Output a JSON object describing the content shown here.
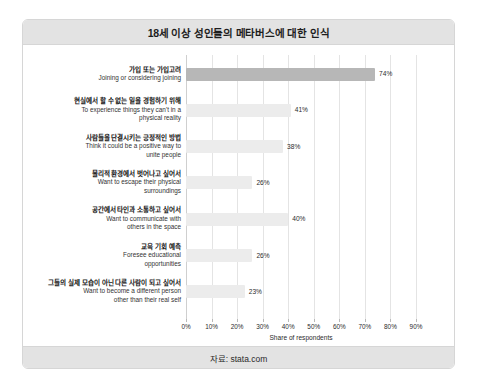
{
  "card": {
    "title": "18세 이상 성인들의 메타버스에 대한 인식",
    "source": "자료: stata.com"
  },
  "chart_data": {
    "type": "bar",
    "orientation": "horizontal",
    "title": "18세 이상 성인들의 메타버스에 대한 인식",
    "xlabel": "Share of respondents",
    "ylabel": "",
    "xlim": [
      0,
      90
    ],
    "grid": true,
    "legend": false,
    "tick_labels": [
      "0%",
      "10%",
      "20%",
      "30%",
      "40%",
      "50%",
      "60%",
      "70%",
      "80%",
      "90%"
    ],
    "ticks": [
      0,
      10,
      20,
      30,
      40,
      50,
      60,
      70,
      80,
      90
    ],
    "highlight_index": 0,
    "highlight_color": "#b7b7b7",
    "bar_color": "#ececec",
    "categories": [
      {
        "ko": "가입 또는 가입고려",
        "en": "Joining or considering joining"
      },
      {
        "ko": "현실에서 할 수 없는 일을 경험하기 위해",
        "en": "To experience things they can't in a\nphysical reality"
      },
      {
        "ko": "사람들을 단결시키는 긍정적인 방법",
        "en": "Think it could be a positive way to\nunite people"
      },
      {
        "ko": "물리적 환경에서 벗어나고 싶어서",
        "en": "Want to escape their physical\nsurroundings"
      },
      {
        "ko": "공간에서 타인과 소통하고 싶어서",
        "en": "Want to communicate with\nothers in the space"
      },
      {
        "ko": "교육 기회 예측",
        "en": "Foresee educational\nopportunities"
      },
      {
        "ko": "그들의 실제 모습이 아닌 다른 사람이 되고 싶어서",
        "en": "Want to become a different person\nother than their real self"
      }
    ],
    "values": [
      74,
      41,
      38,
      26,
      40,
      26,
      23
    ],
    "value_labels": [
      "74%",
      "41%",
      "38%",
      "26%",
      "40%",
      "26%",
      "23%"
    ]
  }
}
